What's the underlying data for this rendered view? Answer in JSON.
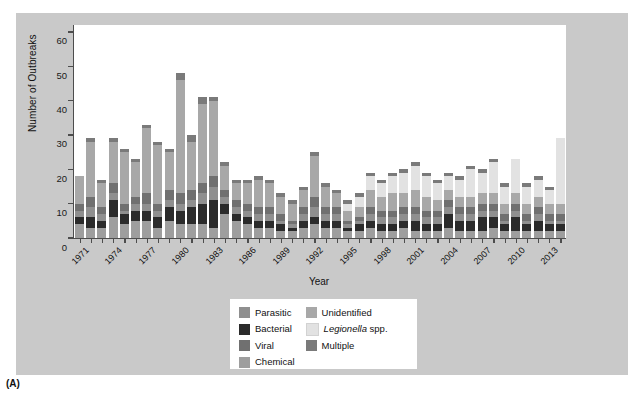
{
  "figure": {
    "panel_tag": "(A)"
  },
  "legend": {
    "columns": [
      [
        {
          "label": "Parasitic",
          "color": "#8f8f8f",
          "italic": false
        },
        {
          "label": "Bacterial",
          "color": "#2b2b2b",
          "italic": false
        },
        {
          "label": "Viral",
          "color": "#707070",
          "italic": false
        },
        {
          "label": "Chemical",
          "color": "#9e9e9e",
          "italic": false
        }
      ],
      [
        {
          "label": "Unidentified",
          "color": "#a8a8a8",
          "italic": false
        },
        {
          "label": "Legionella spp.",
          "color": "#e2e2e2",
          "italic": true,
          "italic_part": "Legionella",
          "plain_part": " spp."
        },
        {
          "label": "Multiple",
          "color": "#7a7a7a",
          "italic": false
        }
      ]
    ]
  },
  "chart_data": {
    "type": "bar",
    "stacked": true,
    "title": "",
    "xlabel": "Year",
    "ylabel": "Number of Outbreaks",
    "ylim": [
      0,
      62
    ],
    "yticks": [
      0,
      10,
      20,
      30,
      40,
      50,
      60
    ],
    "grid": false,
    "legend_position": "below-plot",
    "x_tick_labels": [
      "1971",
      "1974",
      "1977",
      "1980",
      "1983",
      "1986",
      "1989",
      "1992",
      "1995",
      "1998",
      "2001",
      "2004",
      "2007",
      "2010",
      "2013"
    ],
    "x_tick_step_years": 3,
    "categories": [
      "1971",
      "1972",
      "1973",
      "1974",
      "1975",
      "1976",
      "1977",
      "1978",
      "1979",
      "1980",
      "1981",
      "1982",
      "1983",
      "1984",
      "1985",
      "1986",
      "1987",
      "1988",
      "1989",
      "1990",
      "1991",
      "1992",
      "1993",
      "1994",
      "1995",
      "1996",
      "1997",
      "1998",
      "1999",
      "2000",
      "2001",
      "2002",
      "2003",
      "2004",
      "2005",
      "2006",
      "2007",
      "2008",
      "2009",
      "2010",
      "2011",
      "2012",
      "2013",
      "2014"
    ],
    "series": [
      {
        "name": "Chemical",
        "color": "#9e9e9e",
        "values": [
          4,
          3,
          3,
          6,
          4,
          5,
          5,
          3,
          5,
          4,
          4,
          4,
          3,
          7,
          5,
          4,
          3,
          3,
          2,
          2,
          3,
          4,
          3,
          3,
          2,
          2,
          3,
          2,
          2,
          3,
          2,
          2,
          2,
          3,
          2,
          2,
          2,
          3,
          2,
          2,
          2,
          2,
          2,
          2
        ]
      },
      {
        "name": "Bacterial",
        "color": "#2b2b2b",
        "values": [
          2,
          3,
          2,
          5,
          3,
          3,
          3,
          3,
          4,
          4,
          5,
          6,
          8,
          3,
          2,
          2,
          2,
          2,
          2,
          1,
          2,
          2,
          2,
          2,
          1,
          2,
          2,
          2,
          2,
          2,
          3,
          2,
          2,
          4,
          3,
          3,
          4,
          3,
          2,
          4,
          2,
          3,
          2,
          2
        ]
      },
      {
        "name": "Parasitic",
        "color": "#8f8f8f",
        "values": [
          2,
          3,
          2,
          2,
          1,
          2,
          2,
          2,
          2,
          2,
          2,
          3,
          4,
          2,
          2,
          2,
          2,
          2,
          1,
          1,
          2,
          3,
          2,
          2,
          1,
          1,
          2,
          2,
          2,
          2,
          2,
          2,
          2,
          2,
          2,
          2,
          2,
          2,
          1,
          2,
          1,
          2,
          1,
          1
        ]
      },
      {
        "name": "Viral",
        "color": "#707070",
        "values": [
          2,
          3,
          2,
          3,
          2,
          2,
          3,
          2,
          3,
          3,
          3,
          3,
          3,
          2,
          2,
          2,
          2,
          2,
          2,
          1,
          2,
          3,
          2,
          2,
          1,
          1,
          2,
          2,
          2,
          2,
          2,
          2,
          2,
          2,
          2,
          2,
          2,
          2,
          2,
          2,
          2,
          2,
          2,
          2
        ]
      },
      {
        "name": "Unidentified",
        "color": "#a8a8a8",
        "values": [
          8,
          16,
          7,
          12,
          15,
          10,
          19,
          17,
          11,
          33,
          14,
          23,
          22,
          7,
          5,
          6,
          8,
          7,
          5,
          5,
          5,
          12,
          6,
          4,
          3,
          3,
          5,
          4,
          5,
          4,
          5,
          4,
          3,
          3,
          3,
          3,
          3,
          3,
          3,
          3,
          3,
          3,
          3,
          3
        ]
      },
      {
        "name": "Legionella spp.",
        "color": "#e2e2e2",
        "values": [
          0,
          0,
          0,
          0,
          0,
          0,
          0,
          0,
          0,
          0,
          0,
          0,
          0,
          0,
          0,
          0,
          0,
          0,
          0,
          0,
          0,
          0,
          0,
          0,
          2,
          3,
          4,
          4,
          5,
          6,
          7,
          6,
          5,
          4,
          5,
          8,
          6,
          9,
          5,
          10,
          5,
          5,
          4,
          19
        ]
      },
      {
        "name": "Multiple",
        "color": "#7a7a7a",
        "values": [
          0,
          1,
          1,
          1,
          1,
          1,
          1,
          1,
          1,
          2,
          2,
          2,
          1,
          1,
          1,
          1,
          1,
          1,
          1,
          1,
          1,
          1,
          1,
          1,
          1,
          1,
          1,
          1,
          1,
          1,
          1,
          1,
          1,
          1,
          1,
          1,
          1,
          1,
          1,
          0,
          1,
          1,
          1,
          0
        ]
      }
    ],
    "totals": [
      18,
      29,
      17,
      29,
      26,
      23,
      33,
      28,
      26,
      48,
      30,
      41,
      41,
      22,
      17,
      17,
      18,
      17,
      13,
      11,
      15,
      25,
      16,
      14,
      11,
      12,
      19,
      15,
      17,
      18,
      20,
      17,
      15,
      17,
      16,
      20,
      18,
      21,
      14,
      23,
      14,
      16,
      13,
      29
    ]
  }
}
